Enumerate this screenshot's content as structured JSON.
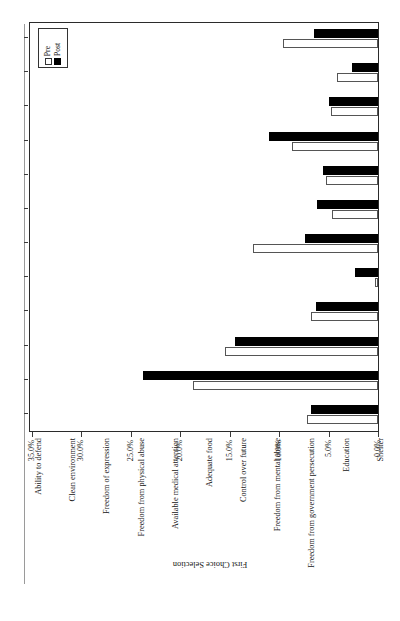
{
  "figure": {
    "number": "Figure 10.1A",
    "title": "Most Important for Personal Security"
  },
  "legend": {
    "title": "",
    "entries": [
      {
        "label": "Post",
        "swatch": "filled-black-square"
      },
      {
        "label": "Pre",
        "swatch": "open-white-square"
      }
    ]
  },
  "axes": {
    "category_axis_title": "First Choice Selection",
    "value_axis_title": "",
    "value_ticks": [
      "0.0%",
      "5.0%",
      "10.0%",
      "15.0%",
      "20.0%",
      "25.0%",
      "30.0%",
      "35.0%"
    ]
  },
  "chart_data": {
    "type": "bar",
    "title": "Most Important for Personal Security",
    "xlabel": "First Choice Selection",
    "ylabel": "",
    "ylim": [
      0,
      35
    ],
    "grid": false,
    "legend_position": "top-left",
    "orientation": "vertical-bars-rotated-page",
    "categories": [
      "Ability to defend",
      "Clean environment",
      "Freedom of expression",
      "Freedom from physical abuse",
      "Available medical attention",
      "Adequate food",
      "Control over future",
      "Freedom from mental abuse",
      "Freedom from government persecution",
      "Education",
      "Shelter",
      "Money"
    ],
    "series": [
      {
        "name": "Post",
        "color": "#000000",
        "values": [
          6.5,
          2.6,
          5.0,
          11.0,
          5.6,
          6.2,
          7.4,
          2.3,
          6.3,
          14.5,
          23.8,
          6.8
        ]
      },
      {
        "name": "Pre",
        "color": "#ffffff",
        "values": [
          9.6,
          4.1,
          4.8,
          8.7,
          5.3,
          4.7,
          12.6,
          0.3,
          6.8,
          15.5,
          18.7,
          7.2
        ]
      }
    ]
  }
}
